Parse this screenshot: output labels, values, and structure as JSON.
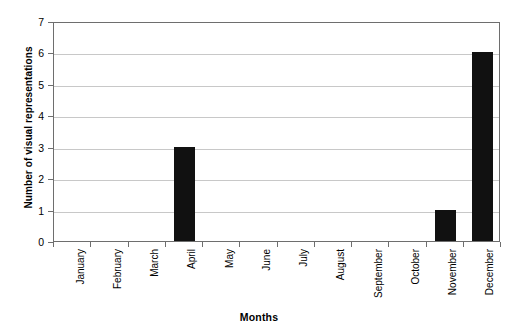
{
  "chart_data": {
    "type": "bar",
    "title": "",
    "xlabel": "Months",
    "ylabel": "Number of visual representations",
    "categories": [
      "January",
      "February",
      "March",
      "April",
      "May",
      "June",
      "July",
      "August",
      "September",
      "October",
      "November",
      "December"
    ],
    "values": [
      0,
      0,
      0,
      3,
      0,
      0,
      0,
      0,
      0,
      0,
      1,
      6
    ],
    "ylim": [
      0,
      7
    ],
    "y_ticks": [
      0,
      1,
      2,
      3,
      4,
      5,
      6,
      7
    ],
    "y_tick_labels": [
      "0",
      "1",
      "2",
      "3",
      "4",
      "5",
      "6",
      "7"
    ],
    "grid": true,
    "grid_axis": "y",
    "legend": false,
    "legend_position": "none",
    "bar_color": "#111111",
    "gridline_color": "#c8c8c8",
    "axis_color": "#6e6e6e",
    "background_color": "#ffffff",
    "x_tick_label_rotation": 90,
    "y_axis_title_rotation": 90
  }
}
